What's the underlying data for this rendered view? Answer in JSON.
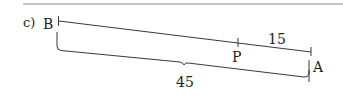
{
  "problem": {
    "label": "c)"
  },
  "points": {
    "B": "B",
    "P": "P",
    "A": "A"
  },
  "measurements": {
    "PA": "15",
    "BA": "45"
  },
  "colors": {
    "ink": "#222222",
    "rule": "#8a8a8a",
    "background": "#ffffff"
  }
}
